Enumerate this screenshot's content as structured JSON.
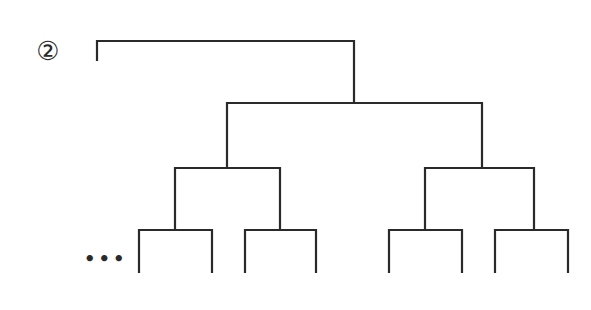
{
  "diagram": {
    "label": "②",
    "ellipsis": "•••",
    "type": "binary-tree-dendrogram",
    "line_color": "#2a2a2a",
    "structure": {
      "root_bar": {
        "y": 41,
        "x1": 97,
        "x2": 354,
        "left_drop_to": 60
      },
      "level2_bar": {
        "y": 103,
        "x1": 227,
        "x2": 482
      },
      "level3_bars": [
        {
          "y": 168,
          "x1": 175,
          "x2": 280
        },
        {
          "y": 168,
          "x1": 425,
          "x2": 534
        }
      ],
      "level4_bars": [
        {
          "y": 230,
          "x1": 139,
          "x2": 212
        },
        {
          "y": 230,
          "x1": 245,
          "x2": 316
        },
        {
          "y": 230,
          "x1": 389,
          "x2": 462
        },
        {
          "y": 230,
          "x1": 495,
          "x2": 568
        }
      ],
      "leaf_bottom_y": 272
    }
  }
}
